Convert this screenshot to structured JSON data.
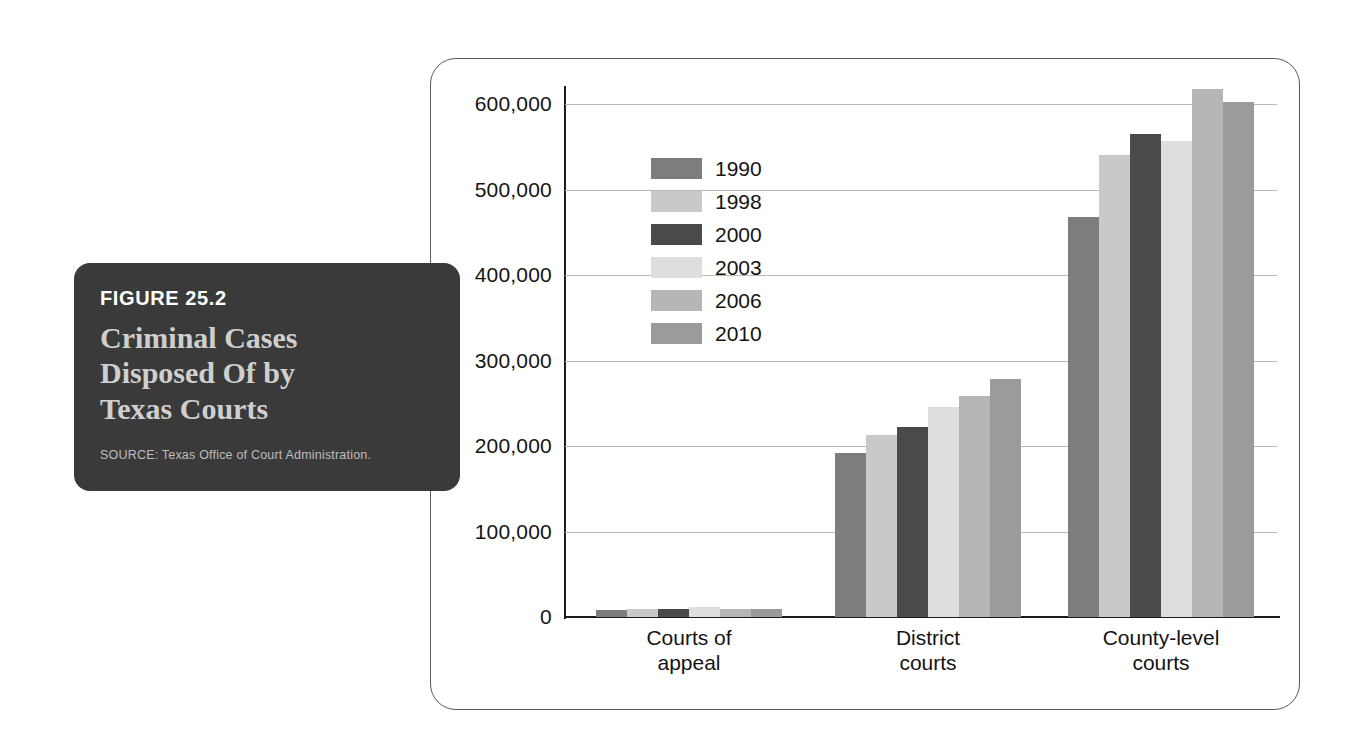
{
  "caption": {
    "figure_number": "FIGURE 25.2",
    "title_lines": [
      "Criminal Cases",
      "Disposed Of by",
      "Texas Courts"
    ],
    "source": "SOURCE: Texas Office of Court Administration."
  },
  "legend": {
    "position": "inside-top-left",
    "entries": [
      {
        "label": "1990",
        "color": "#7d7d7d"
      },
      {
        "label": "1998",
        "color": "#c9c9c9"
      },
      {
        "label": "2000",
        "color": "#4a4a4a"
      },
      {
        "label": "2003",
        "color": "#dedede"
      },
      {
        "label": "2006",
        "color": "#b6b6b6"
      },
      {
        "label": "2010",
        "color": "#9b9b9b"
      }
    ]
  },
  "axis": {
    "y_ticks": [
      "600,000",
      "500,000",
      "400,000",
      "300,000",
      "200,000",
      "100,000",
      "0"
    ],
    "y_tick_values": [
      600000,
      500000,
      400000,
      300000,
      200000,
      100000,
      0
    ],
    "x_categories": [
      {
        "line1": "Courts of",
        "line2": "appeal"
      },
      {
        "line1": "District",
        "line2": "courts"
      },
      {
        "line1": "County-level",
        "line2": "courts"
      }
    ]
  },
  "chart_data": {
    "type": "bar",
    "title": "Criminal Cases Disposed Of by Texas Courts",
    "subtitle": "FIGURE 25.2",
    "xlabel": "",
    "ylabel": "",
    "ylim": [
      0,
      600000
    ],
    "grid": true,
    "legend_position": "upper left (inside plot)",
    "categories": [
      "Courts of appeal",
      "District courts",
      "County-level courts"
    ],
    "series": [
      {
        "name": "1990",
        "color": "#7d7d7d",
        "values": [
          8000,
          192000,
          468000
        ]
      },
      {
        "name": "1998",
        "color": "#c9c9c9",
        "values": [
          9000,
          213000,
          540000
        ]
      },
      {
        "name": "2000",
        "color": "#4a4a4a",
        "values": [
          9500,
          222000,
          565000
        ]
      },
      {
        "name": "2003",
        "color": "#dedede",
        "values": [
          12000,
          246000,
          557000
        ]
      },
      {
        "name": "2006",
        "color": "#b6b6b6",
        "values": [
          9000,
          258000,
          617000
        ]
      },
      {
        "name": "2010",
        "color": "#9b9b9b",
        "values": [
          9500,
          278000,
          602000
        ]
      }
    ],
    "annotations": [],
    "source": "Texas Office of Court Administration."
  },
  "geometry": {
    "group_left_px": [
      596,
      835,
      1068
    ],
    "bar_width_px": 31,
    "plot_height_px": 513,
    "plot_top_value": 600000
  }
}
